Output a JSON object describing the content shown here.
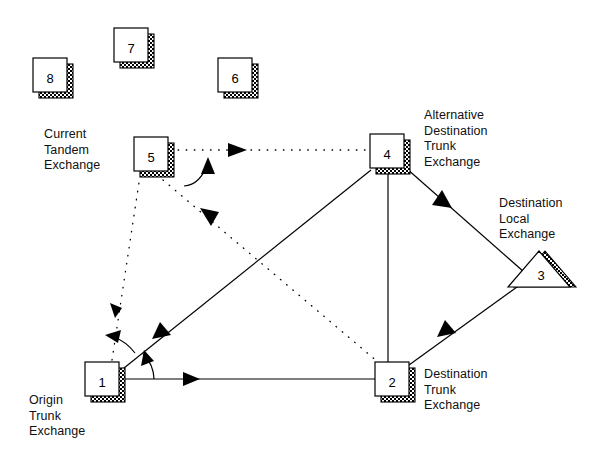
{
  "diagram": {
    "colors": {
      "stroke": "#000000",
      "fill": "#ffffff",
      "shadow": "#1a1a1a",
      "text": "#101010"
    },
    "nodes": [
      {
        "id": "node-8",
        "label": "8",
        "shape": "box",
        "x": 33,
        "y": 58,
        "w": 34,
        "h": 34
      },
      {
        "id": "node-7",
        "label": "7",
        "shape": "box",
        "x": 114,
        "y": 28,
        "w": 34,
        "h": 34
      },
      {
        "id": "node-6",
        "label": "6",
        "shape": "box",
        "x": 218,
        "y": 58,
        "w": 34,
        "h": 34
      },
      {
        "id": "node-5",
        "label": "5",
        "shape": "box",
        "x": 134,
        "y": 137,
        "w": 34,
        "h": 34
      },
      {
        "id": "node-4",
        "label": "4",
        "shape": "box",
        "x": 370,
        "y": 134,
        "w": 34,
        "h": 34
      },
      {
        "id": "node-3",
        "label": "3",
        "shape": "triangle",
        "x": 508,
        "y": 251,
        "w": 62,
        "h": 36
      },
      {
        "id": "node-2",
        "label": "2",
        "shape": "box",
        "x": 375,
        "y": 362,
        "w": 34,
        "h": 34
      },
      {
        "id": "node-1",
        "label": "1",
        "shape": "box",
        "x": 85,
        "y": 362,
        "w": 34,
        "h": 34
      }
    ],
    "captions": [
      {
        "id": "caption-current-tandem-exchange",
        "text": "Current\nTandem\nExchange",
        "x": 44,
        "y": 127,
        "align": "left"
      },
      {
        "id": "caption-alternative-destination-trunk",
        "text": "Alternative\nDestination\nTrunk\nExchange",
        "x": 424,
        "y": 108,
        "align": "left"
      },
      {
        "id": "caption-destination-local-exchange",
        "text": "Destination\nLocal\nExchange",
        "x": 499,
        "y": 196,
        "align": "left"
      },
      {
        "id": "caption-destination-trunk-exchange",
        "text": "Destination\nTrunk\nExchange",
        "x": 424,
        "y": 367,
        "align": "left"
      },
      {
        "id": "caption-origin-trunk-exchange",
        "text": "Origin\nTrunk\nExchange",
        "x": 29,
        "y": 393,
        "align": "left"
      }
    ],
    "links": [
      {
        "id": "link-1-to-4",
        "style": "solid",
        "from": "node-1",
        "to": "node-4",
        "arrow": "both-mid"
      },
      {
        "id": "link-1-to-2",
        "style": "solid",
        "from": "node-1",
        "to": "node-2",
        "arrow": "mid-right"
      },
      {
        "id": "link-4-to-2",
        "style": "solid",
        "from": "node-4",
        "to": "node-2",
        "arrow": "none"
      },
      {
        "id": "link-4-to-3",
        "style": "solid",
        "from": "node-4",
        "to": "node-3",
        "arrow": "mid-down"
      },
      {
        "id": "link-2-to-3",
        "style": "solid",
        "from": "node-2",
        "to": "node-3",
        "arrow": "mid-up"
      },
      {
        "id": "link-1-to-5",
        "style": "dotted",
        "from": "node-1",
        "to": "node-5",
        "arrow": "mid-down"
      },
      {
        "id": "link-5-to-4",
        "style": "dotted",
        "from": "node-5",
        "to": "node-4",
        "arrow": "mid-right"
      },
      {
        "id": "link-5-to-2",
        "style": "dotted",
        "from": "node-5",
        "to": "node-2",
        "arrow": "mid-up-left"
      }
    ],
    "arcs": [
      {
        "id": "arc-near-node-1-to-diagonal",
        "description": "angle arc from horizontal link to diagonal link at node 1"
      },
      {
        "id": "arc-near-node-1-to-dotted",
        "description": "curved arrow from node 1 toward dotted tandem route"
      },
      {
        "id": "arc-near-node-5",
        "description": "curved arrow rising into dotted route beside node 5"
      }
    ]
  }
}
